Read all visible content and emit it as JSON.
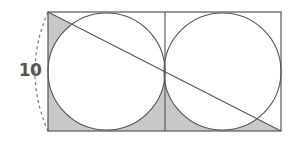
{
  "diagram": {
    "type": "geometry",
    "side_label": "10",
    "colors": {
      "stroke": "#555555",
      "shade": "#c8c8c8",
      "dashed": "#777777",
      "label": "#555555"
    },
    "rectangle": {
      "x": 48,
      "y": 12,
      "width": 233,
      "height": 119
    },
    "circles": [
      {
        "cx": 106.5,
        "cy": 71.5,
        "r": 58.5
      },
      {
        "cx": 222.5,
        "cy": 71.5,
        "r": 58.5
      }
    ],
    "divider_x": 165,
    "diagonal": {
      "x1": 48,
      "y1": 12,
      "x2": 281,
      "y2": 131
    }
  }
}
